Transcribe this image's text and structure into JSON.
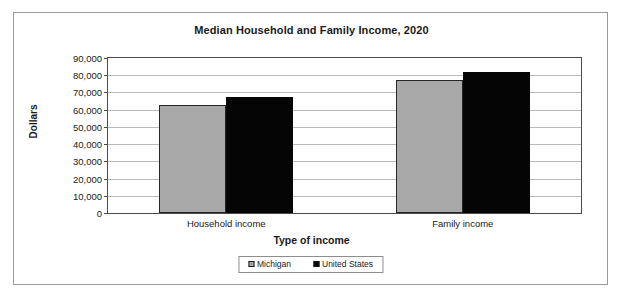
{
  "chart_data": {
    "type": "bar",
    "title": "Median Household and Family Income, 2020",
    "xlabel": "Type of income",
    "ylabel": "Dollars",
    "categories": [
      "Household income",
      "Family income"
    ],
    "series": [
      {
        "name": "Michigan",
        "color": "#a8a8a8",
        "values": [
          63000,
          77000
        ]
      },
      {
        "name": "United States",
        "color": "#050505",
        "values": [
          67500,
          82000
        ]
      }
    ],
    "ylim": [
      0,
      90000
    ],
    "ytick_values": [
      0,
      10000,
      20000,
      30000,
      40000,
      50000,
      60000,
      70000,
      80000,
      90000
    ],
    "ytick_labels": [
      "0",
      "10,000",
      "20,000",
      "30,000",
      "40,000",
      "50,000",
      "60,000",
      "70,000",
      "80,000",
      "90,000"
    ],
    "grid": true,
    "legend_position": "bottom"
  }
}
